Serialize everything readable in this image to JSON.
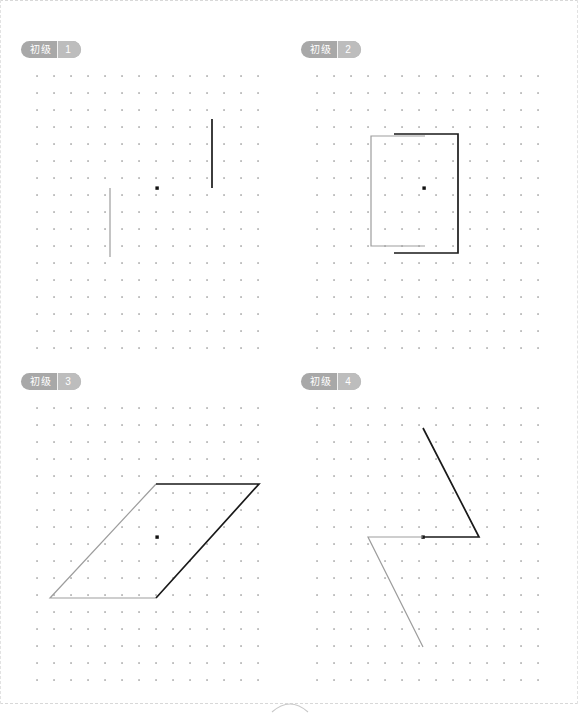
{
  "page": {
    "border_style": "dashed",
    "border_color": "#d8d8d8",
    "background": "#ffffff"
  },
  "grid": {
    "dot_color": "#9a9a9a",
    "center_dot_color": "#111111",
    "spacing_px": 17,
    "cols": 14,
    "rows": 17,
    "origin_x": 16,
    "origin_y": 13
  },
  "palette": {
    "dark_stroke": "#1a1a1a",
    "light_stroke": "#9d9d9d",
    "badge_bg": "#a8a8a8",
    "badge_num_bg": "#bdbdbd",
    "badge_text": "#ffffff"
  },
  "panels": [
    {
      "id": 1,
      "badge": {
        "level": "初级",
        "number": "1"
      },
      "figure_type": "line-segments",
      "center": {
        "x": 136,
        "y": 125
      },
      "shapes": [
        {
          "name": "dark-vertical-segment",
          "tone": "dark",
          "points": [
            [
              191,
              56
            ],
            [
              191,
              125
            ]
          ]
        },
        {
          "name": "light-vertical-segment",
          "tone": "light",
          "points": [
            [
              89,
              125
            ],
            [
              89,
              194
            ]
          ]
        }
      ]
    },
    {
      "id": 2,
      "badge": {
        "level": "初级",
        "number": "2"
      },
      "figure_type": "bracket-pair",
      "center": {
        "x": 123,
        "y": 125
      },
      "shapes": [
        {
          "name": "light-bracket",
          "tone": "light",
          "points": [
            [
              124,
              73
            ],
            [
              70,
              73
            ],
            [
              70,
              183
            ],
            [
              124,
              183
            ]
          ]
        },
        {
          "name": "dark-bracket",
          "tone": "dark",
          "points": [
            [
              93,
              71
            ],
            [
              157,
              71
            ],
            [
              157,
              190
            ],
            [
              93,
              190
            ]
          ]
        }
      ]
    },
    {
      "id": 3,
      "badge": {
        "level": "初级",
        "number": "3"
      },
      "figure_type": "parallelogram-halves",
      "center": {
        "x": 136,
        "y": 142
      },
      "shapes": [
        {
          "name": "light-half-parallelogram",
          "tone": "light",
          "points": [
            [
              135,
              89
            ],
            [
              29,
              203
            ],
            [
              135,
              203
            ]
          ]
        },
        {
          "name": "dark-half-parallelogram",
          "tone": "dark",
          "points": [
            [
              135,
              89
            ],
            [
              238,
              89
            ],
            [
              135,
              203
            ]
          ]
        }
      ]
    },
    {
      "id": 4,
      "badge": {
        "level": "初级",
        "number": "4"
      },
      "figure_type": "triangle-pair-rotation",
      "center": {
        "x": 122,
        "y": 142
      },
      "shapes": [
        {
          "name": "dark-triangle",
          "tone": "dark",
          "points": [
            [
              122,
              33
            ],
            [
              178,
              142
            ],
            [
              122,
              142
            ]
          ]
        },
        {
          "name": "light-triangle",
          "tone": "light",
          "points": [
            [
              122,
              142
            ],
            [
              67,
              142
            ],
            [
              122,
              252
            ]
          ]
        }
      ]
    }
  ],
  "footer": {
    "arc_label": "page-fold-arc"
  }
}
